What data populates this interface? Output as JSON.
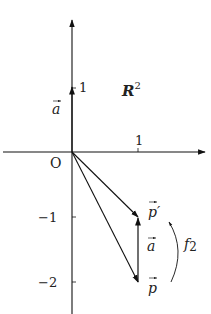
{
  "diagram": {
    "space_label": "R",
    "space_exp": "2",
    "origin_label": "O",
    "ticks": {
      "x_pos1": "1",
      "y_pos1": "1",
      "y_neg1": "−1",
      "y_neg2": "−2"
    },
    "vectors": {
      "a_on_axis": "a",
      "p_prime": "p′",
      "a_translation": "a",
      "p": "p"
    },
    "map_label": "f",
    "map_sub": "2",
    "colors": {
      "stroke": "#111111",
      "text": "#222222"
    }
  }
}
